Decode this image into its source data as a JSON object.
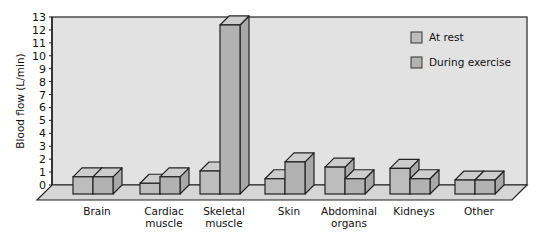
{
  "chart_data": {
    "type": "bar",
    "title": "",
    "xlabel": "",
    "ylabel": "Blood flow (L/min)",
    "ylim": [
      0,
      13
    ],
    "yticks": [
      0,
      1,
      2,
      3,
      4,
      5,
      6,
      7,
      8,
      9,
      10,
      11,
      12,
      13
    ],
    "grid": false,
    "legend_position": "upper right (inside)",
    "style": "3d",
    "categories": [
      [
        "Brain"
      ],
      [
        "Cardiac",
        "muscle"
      ],
      [
        "Skeletal",
        "muscle"
      ],
      [
        "Skin"
      ],
      [
        "Abdominal",
        "organs"
      ],
      [
        "Kidneys"
      ],
      [
        "Other"
      ]
    ],
    "series": [
      {
        "name": "At rest",
        "values": [
          0.75,
          0.25,
          1.2,
          0.6,
          1.5,
          1.4,
          0.5
        ]
      },
      {
        "name": "During exercise",
        "values": [
          0.75,
          0.75,
          12.5,
          1.9,
          0.6,
          0.6,
          0.5
        ]
      }
    ]
  },
  "colors": {
    "wall": "#e2e2e2",
    "floor": "#d6d6d6",
    "rest_front": "#bdbdbd",
    "exercise_front": "#b2b2b2",
    "side": "#a8a8a8",
    "top": "#cdcdcd",
    "stroke": "#222222"
  }
}
